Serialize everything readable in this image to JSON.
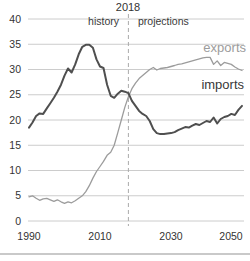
{
  "page": {
    "background": "#ffffff"
  },
  "chart_data": {
    "type": "line",
    "title": "",
    "xlabel": "",
    "ylabel": "",
    "xlim": [
      1990,
      2050
    ],
    "ylim": [
      0,
      40
    ],
    "xticks": [
      1990,
      2010,
      2030,
      2050
    ],
    "yticks": [
      0,
      5,
      10,
      15,
      20,
      25,
      30,
      35,
      40
    ],
    "grid": true,
    "grid_color": "#cccccc",
    "x": [
      1990,
      1991,
      1992,
      1993,
      1994,
      1995,
      1996,
      1997,
      1998,
      1999,
      2000,
      2001,
      2002,
      2003,
      2004,
      2005,
      2006,
      2007,
      2008,
      2009,
      2010,
      2011,
      2012,
      2013,
      2014,
      2015,
      2016,
      2017,
      2018,
      2019,
      2020,
      2021,
      2022,
      2023,
      2024,
      2025,
      2026,
      2027,
      2028,
      2029,
      2030,
      2031,
      2032,
      2033,
      2034,
      2035,
      2036,
      2037,
      2038,
      2039,
      2040,
      2041,
      2042,
      2043,
      2044,
      2045,
      2046,
      2047,
      2048,
      2049,
      2050
    ],
    "series": [
      {
        "name": "exports",
        "color": "#9c9c9c",
        "values": [
          4.8,
          5.0,
          4.5,
          4.1,
          4.4,
          4.5,
          4.2,
          3.9,
          4.2,
          3.8,
          3.5,
          3.8,
          3.6,
          4.0,
          4.5,
          5.0,
          5.8,
          7.0,
          8.5,
          9.8,
          10.8,
          11.8,
          13.0,
          13.6,
          15.0,
          17.5,
          20.0,
          22.5,
          24.6,
          26.2,
          27.3,
          28.2,
          28.8,
          29.4,
          30.0,
          30.4,
          29.9,
          30.2,
          30.3,
          30.4,
          30.6,
          30.8,
          31.0,
          31.1,
          31.3,
          31.5,
          31.7,
          31.9,
          32.1,
          32.3,
          32.4,
          32.4,
          31.0,
          31.7,
          30.8,
          31.4,
          31.2,
          31.0,
          30.5,
          30.1,
          29.8
        ]
      },
      {
        "name": "imports",
        "color": "#4f4f4f",
        "values": [
          18.5,
          19.5,
          20.8,
          21.3,
          21.2,
          22.3,
          23.3,
          24.4,
          25.6,
          27.0,
          28.8,
          30.2,
          29.4,
          31.0,
          33.0,
          34.5,
          34.9,
          34.9,
          34.3,
          32.0,
          30.6,
          30.3,
          27.0,
          24.8,
          24.4,
          25.2,
          25.8,
          25.6,
          25.3,
          23.8,
          22.8,
          21.8,
          21.2,
          20.8,
          19.8,
          18.2,
          17.4,
          17.2,
          17.2,
          17.3,
          17.4,
          17.6,
          18.0,
          18.3,
          18.6,
          18.5,
          18.9,
          19.2,
          19.0,
          19.4,
          19.8,
          19.6,
          20.5,
          19.3,
          20.2,
          20.6,
          20.8,
          21.2,
          21.0,
          22.0,
          22.8
        ]
      }
    ],
    "annotations": {
      "divider_label": "2018",
      "divider_year": 2018,
      "divider_color": "#aaaaaa",
      "left_region": "history",
      "right_region": "projections"
    }
  }
}
